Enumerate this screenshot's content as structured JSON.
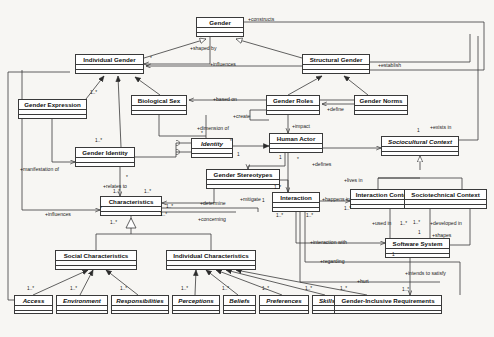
{
  "diagram": {
    "type": "uml-class-diagram",
    "stroke_color": "#3a3a3a",
    "fill_color": "#ffffff",
    "background": "#f7f6f3"
  },
  "classes": [
    {
      "id": "gender",
      "name": "Gender",
      "abstract": false,
      "x": 196,
      "y": 17,
      "w": 48,
      "h": 20
    },
    {
      "id": "individual",
      "name": "Individual Gender",
      "abstract": false,
      "x": 75,
      "y": 54,
      "w": 69,
      "h": 20
    },
    {
      "id": "structural",
      "name": "Structural Gender",
      "abstract": false,
      "x": 302,
      "y": 54,
      "w": 68,
      "h": 20
    },
    {
      "id": "genderexpr",
      "name": "Gender Expression",
      "abstract": false,
      "x": 18,
      "y": 99,
      "w": 69,
      "h": 20
    },
    {
      "id": "biologicalsex",
      "name": "Biological Sex",
      "abstract": false,
      "x": 131,
      "y": 95,
      "w": 56,
      "h": 20
    },
    {
      "id": "genderroles",
      "name": "Gender Roles",
      "abstract": false,
      "x": 266,
      "y": 95,
      "w": 54,
      "h": 20
    },
    {
      "id": "gendernorms",
      "name": "Gender Norms",
      "abstract": false,
      "x": 354,
      "y": 95,
      "w": 54,
      "h": 20
    },
    {
      "id": "identity",
      "name": "Identity",
      "abstract": true,
      "x": 191,
      "y": 138,
      "w": 42,
      "h": 20
    },
    {
      "id": "genderidty",
      "name": "Gender Identity",
      "abstract": false,
      "x": 75,
      "y": 147,
      "w": 60,
      "h": 20
    },
    {
      "id": "humanactor",
      "name": "Human Actor",
      "abstract": false,
      "x": 269,
      "y": 133,
      "w": 54,
      "h": 20
    },
    {
      "id": "sociocultural",
      "name": "Sociocultural Context",
      "abstract": true,
      "x": 381,
      "y": 136,
      "w": 78,
      "h": 20
    },
    {
      "id": "stereotypes",
      "name": "Gender Stereotypes",
      "abstract": false,
      "x": 206,
      "y": 169,
      "w": 74,
      "h": 20
    },
    {
      "id": "interaction",
      "name": "Interaction",
      "abstract": false,
      "x": 272,
      "y": 192,
      "w": 48,
      "h": 20
    },
    {
      "id": "intcontext",
      "name": "Interaction Context",
      "abstract": false,
      "x": 350,
      "y": 189,
      "w": 68,
      "h": 20
    },
    {
      "id": "sociotech",
      "name": "Sociotechnical Context",
      "abstract": false,
      "x": 404,
      "y": 189,
      "w": 83,
      "h": 20
    },
    {
      "id": "characteristics",
      "name": "Characteristics",
      "abstract": false,
      "x": 100,
      "y": 196,
      "w": 62,
      "h": 20
    },
    {
      "id": "software",
      "name": "Software System",
      "abstract": false,
      "x": 385,
      "y": 238,
      "w": 65,
      "h": 20
    },
    {
      "id": "socialchar",
      "name": "Social Characteristics",
      "abstract": false,
      "x": 55,
      "y": 250,
      "w": 82,
      "h": 20
    },
    {
      "id": "indivchar",
      "name": "Individual Characteristics",
      "abstract": false,
      "x": 166,
      "y": 250,
      "w": 90,
      "h": 20
    },
    {
      "id": "access",
      "name": "Access",
      "abstract": true,
      "x": 14,
      "y": 295,
      "w": 39,
      "h": 19
    },
    {
      "id": "environment",
      "name": "Environment",
      "abstract": true,
      "x": 56,
      "y": 295,
      "w": 52,
      "h": 19
    },
    {
      "id": "responsibilities",
      "name": "Responsibilities",
      "abstract": true,
      "x": 111,
      "y": 295,
      "w": 58,
      "h": 19
    },
    {
      "id": "perceptions",
      "name": "Perceptions",
      "abstract": true,
      "x": 172,
      "y": 295,
      "w": 48,
      "h": 19
    },
    {
      "id": "beliefs",
      "name": "Beliefs",
      "abstract": true,
      "x": 223,
      "y": 295,
      "w": 33,
      "h": 19
    },
    {
      "id": "preferences",
      "name": "Preferences",
      "abstract": true,
      "x": 259,
      "y": 295,
      "w": 50,
      "h": 19
    },
    {
      "id": "skills",
      "name": "Skills",
      "abstract": true,
      "x": 312,
      "y": 295,
      "w": 30,
      "h": 19
    },
    {
      "id": "motivations",
      "name": "Motivations",
      "abstract": true,
      "x": 345,
      "y": 295,
      "w": 48,
      "h": 19
    },
    {
      "id": "requirements",
      "name": "Gender-Inclusive Requirements",
      "abstract": false,
      "x": 334,
      "y": 295,
      "w": 108,
      "h": 19
    }
  ],
  "edge_labels": [
    {
      "id": "constructs",
      "text": "+constructs",
      "x": 248,
      "y": 16
    },
    {
      "id": "shapedby",
      "text": "+shaped by",
      "x": 190,
      "y": 45
    },
    {
      "id": "influences_top",
      "text": "+influences",
      "x": 210,
      "y": 61
    },
    {
      "id": "establish",
      "text": "+establish",
      "x": 378,
      "y": 62
    },
    {
      "id": "basedon",
      "text": "+based on",
      "x": 213,
      "y": 96
    },
    {
      "id": "define",
      "text": "+define",
      "x": 327,
      "y": 106
    },
    {
      "id": "create",
      "text": "+create",
      "x": 233,
      "y": 113
    },
    {
      "id": "dimensionof",
      "text": "+dimension of",
      "x": 197,
      "y": 125
    },
    {
      "id": "impact",
      "text": "+impact",
      "x": 292,
      "y": 123
    },
    {
      "id": "existsin",
      "text": "+exists in",
      "x": 430,
      "y": 124
    },
    {
      "id": "manifestationof",
      "text": "+manifestation of",
      "x": 20,
      "y": 166
    },
    {
      "id": "relatesto",
      "text": "+relates to",
      "x": 103,
      "y": 183
    },
    {
      "id": "defines",
      "text": "+defines",
      "x": 312,
      "y": 161
    },
    {
      "id": "livesin",
      "text": "+lives in",
      "x": 344,
      "y": 177
    },
    {
      "id": "determine",
      "text": "+determine",
      "x": 200,
      "y": 200
    },
    {
      "id": "mitigate",
      "text": "+mitigate",
      "x": 240,
      "y": 196
    },
    {
      "id": "influences_left",
      "text": "+influences",
      "x": 45,
      "y": 211
    },
    {
      "id": "happensin",
      "text": "+happens in",
      "x": 322,
      "y": 196
    },
    {
      "id": "concerning",
      "text": "+concerning",
      "x": 198,
      "y": 216
    },
    {
      "id": "usedin",
      "text": "+used in",
      "x": 372,
      "y": 220
    },
    {
      "id": "developedin",
      "text": "+developed in",
      "x": 430,
      "y": 220
    },
    {
      "id": "shapes",
      "text": "+shapes",
      "x": 432,
      "y": 232
    },
    {
      "id": "interactionwith",
      "text": "+interaction with",
      "x": 310,
      "y": 239
    },
    {
      "id": "regarding",
      "text": "+regarding",
      "x": 320,
      "y": 258
    },
    {
      "id": "intendstosatisfy",
      "text": "+intends to satisfy",
      "x": 405,
      "y": 270
    },
    {
      "id": "hurt",
      "text": "+hurt",
      "x": 357,
      "y": 278
    }
  ],
  "multiplicities": [
    {
      "id": "m-ig-star",
      "text": "*",
      "x": 150,
      "y": 56
    },
    {
      "id": "m-ge-1star",
      "text": "1..*",
      "x": 90,
      "y": 90
    },
    {
      "id": "m-gi-1star",
      "text": "1..*",
      "x": 95,
      "y": 138
    },
    {
      "id": "m-id-star",
      "text": "*",
      "x": 201,
      "y": 131
    },
    {
      "id": "m-id-1",
      "text": "1",
      "x": 237,
      "y": 152
    },
    {
      "id": "m-ha-1",
      "text": "1",
      "x": 279,
      "y": 155
    },
    {
      "id": "m-ha-star",
      "text": "*",
      "x": 297,
      "y": 157
    },
    {
      "id": "m-sc-1",
      "text": "1",
      "x": 417,
      "y": 128
    },
    {
      "id": "m-gi-star",
      "text": "*",
      "x": 126,
      "y": 175
    },
    {
      "id": "m-ch-1s1",
      "text": "1..*",
      "x": 113,
      "y": 189
    },
    {
      "id": "m-ch-1s2",
      "text": "1..*",
      "x": 144,
      "y": 189
    },
    {
      "id": "m-ch-star",
      "text": "*",
      "x": 100,
      "y": 206
    },
    {
      "id": "m-ch-1s3",
      "text": "1..*",
      "x": 166,
      "y": 204
    },
    {
      "id": "m-ch-1s4",
      "text": "1..*",
      "x": 160,
      "y": 212
    },
    {
      "id": "m-st-1star",
      "text": "1..*",
      "x": 274,
      "y": 185
    },
    {
      "id": "m-in-1",
      "text": "1",
      "x": 262,
      "y": 198
    },
    {
      "id": "m-in-1s",
      "text": "1..*",
      "x": 276,
      "y": 213
    },
    {
      "id": "m-ic-1s",
      "text": "1..*",
      "x": 306,
      "y": 213
    },
    {
      "id": "m-ha-1b",
      "text": "1..*",
      "x": 344,
      "y": 206
    },
    {
      "id": "m-in-1s2",
      "text": "1..*",
      "x": 110,
      "y": 220
    },
    {
      "id": "m-uc-1s",
      "text": "1..*",
      "x": 400,
      "y": 221
    },
    {
      "id": "m-dv-1s",
      "text": "1..*",
      "x": 413,
      "y": 220
    },
    {
      "id": "m-sw-1",
      "text": "1",
      "x": 418,
      "y": 230
    },
    {
      "id": "m-sw-1b",
      "text": "1",
      "x": 392,
      "y": 252
    },
    {
      "id": "m-gr-1s",
      "text": "1..*",
      "x": 402,
      "y": 287
    },
    {
      "id": "m-ac-1s",
      "text": "1..*",
      "x": 27,
      "y": 286
    },
    {
      "id": "m-en-1s",
      "text": "1..*",
      "x": 70,
      "y": 286
    },
    {
      "id": "m-re-1s",
      "text": "1..*",
      "x": 120,
      "y": 286
    },
    {
      "id": "m-pe-1s",
      "text": "1..*",
      "x": 181,
      "y": 286
    },
    {
      "id": "m-be-1s",
      "text": "1..*",
      "x": 222,
      "y": 286
    },
    {
      "id": "m-pr-1s",
      "text": "1..*",
      "x": 262,
      "y": 286
    },
    {
      "id": "m-sk-1s",
      "text": "1..*",
      "x": 305,
      "y": 286
    },
    {
      "id": "m-mo-1s",
      "text": "1..*",
      "x": 340,
      "y": 286
    },
    {
      "id": "m-gn-star",
      "text": "*",
      "x": 230,
      "y": 139
    }
  ]
}
